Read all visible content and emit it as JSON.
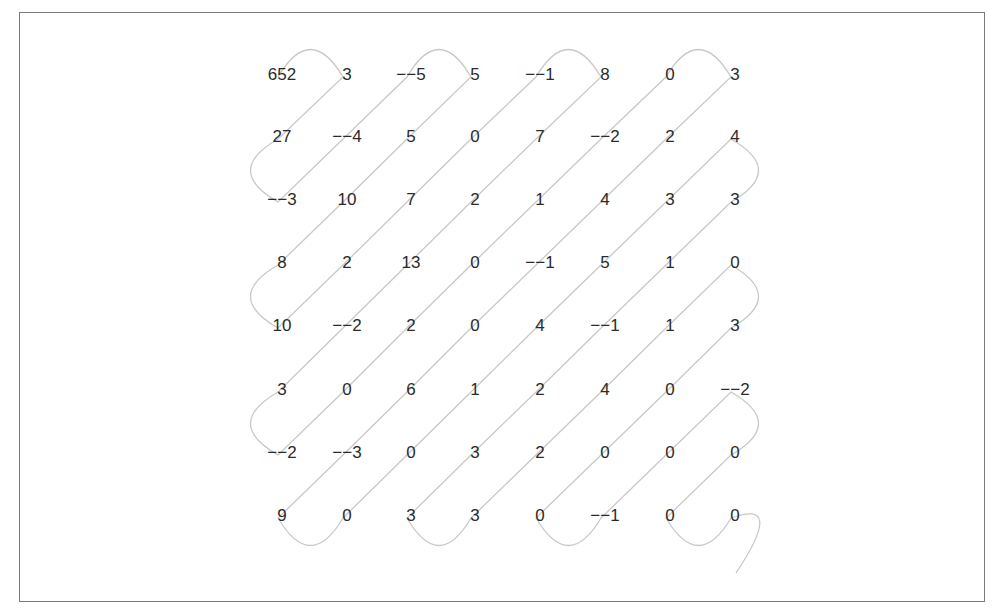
{
  "diagram": {
    "type": "zigzag-scan",
    "grid_size": 8,
    "colors": {
      "border": "#7a7a7a",
      "path": "#c8c8c8",
      "text": "#2b2b2b"
    },
    "matrix": [
      [
        "652",
        "3",
        "−−5",
        "5",
        "−−1",
        "8",
        "0",
        "3"
      ],
      [
        "27",
        "−−4",
        "5",
        "0",
        "7",
        "−−2",
        "2",
        "4"
      ],
      [
        "−−3",
        "10",
        "7",
        "2",
        "1",
        "4",
        "3",
        "3"
      ],
      [
        "8",
        "2",
        "13",
        "0",
        "−−1",
        "5",
        "1",
        "0"
      ],
      [
        "10",
        "−−2",
        "2",
        "0",
        "4",
        "−−1",
        "1",
        "3"
      ],
      [
        "3",
        "0",
        "6",
        "1",
        "2",
        "4",
        "0",
        "−−2"
      ],
      [
        "−−2",
        "−−3",
        "0",
        "3",
        "2",
        "0",
        "0",
        "0"
      ],
      [
        "9",
        "0",
        "3",
        "3",
        "0",
        "−−1",
        "0",
        "0"
      ]
    ]
  }
}
